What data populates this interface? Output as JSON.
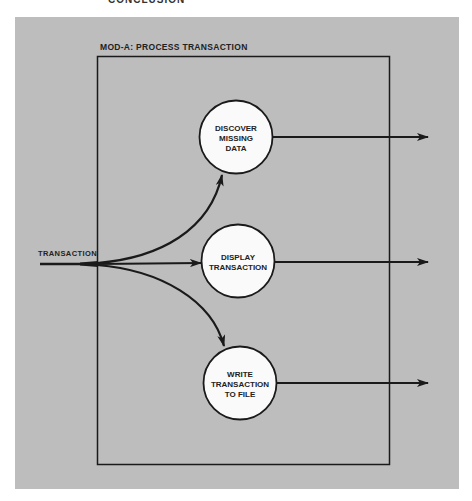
{
  "caption_fragment": "CONCLUSION",
  "colors": {
    "panel": "#bdbdbd",
    "page": "#ffffff",
    "stroke": "#1a1a1a",
    "bubble_fill": "#fafafa",
    "text": "#222222"
  },
  "module": {
    "title": "MOD-A: PROCESS TRANSACTION"
  },
  "input": {
    "label": "TRANSACTION"
  },
  "processes": [
    {
      "id": "discover",
      "line1": "DISCOVER",
      "line2": "MISSING",
      "line3": "DATA"
    },
    {
      "id": "display",
      "line1": "DISPLAY",
      "line2": "TRANSACTION"
    },
    {
      "id": "write",
      "line1": "WRITE",
      "line2": "TRANSACTION",
      "line3": "TO FILE"
    }
  ]
}
